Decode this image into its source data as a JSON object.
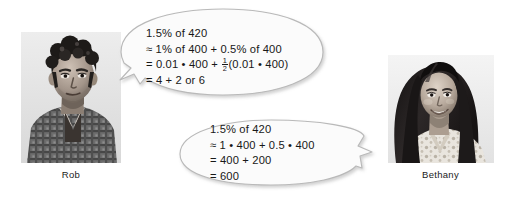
{
  "scene": {
    "background_color": "#ffffff",
    "bubble_fill": "#fbfbfb",
    "bubble_stroke": "#b9b9b9",
    "text_color": "#181818"
  },
  "people": [
    {
      "id": "rob",
      "caption": "Rob",
      "photo_name": "photo-of-rob",
      "photo_description": "grayscale portrait of a teenage boy with dark curly hair wearing a plaid shirt"
    },
    {
      "id": "bethany",
      "caption": "Bethany",
      "photo_name": "photo-of-bethany",
      "photo_description": "grayscale portrait of a smiling teenage girl with long dark hair wearing a patterned blouse"
    }
  ],
  "bubbles": [
    {
      "id": "bubble-rob",
      "speaker": "Rob",
      "tail_direction": "lower-left",
      "lines": [
        {
          "text": "1.5% of 420",
          "has_fraction": false
        },
        {
          "text": "≈ 1% of 400 + 0.5% of 400",
          "has_fraction": false
        },
        {
          "has_fraction": true,
          "prefix": "= 0.01 • 400 + ",
          "fraction": {
            "numerator": "1",
            "denominator": "2"
          },
          "suffix": "(0.01 • 400)",
          "text": "= 0.01 • 400 + 1/2(0.01 • 400)"
        },
        {
          "text": "= 4 + 2 or 6",
          "has_fraction": false
        }
      ]
    },
    {
      "id": "bubble-bethany",
      "speaker": "Bethany",
      "tail_direction": "upper-right",
      "lines": [
        {
          "text": "1.5% of 420",
          "has_fraction": false
        },
        {
          "text": "≈ 1 • 400 + 0.5 • 400",
          "has_fraction": false
        },
        {
          "text": "= 400 + 200",
          "has_fraction": false
        },
        {
          "text": "= 600",
          "has_fraction": false
        }
      ]
    }
  ]
}
